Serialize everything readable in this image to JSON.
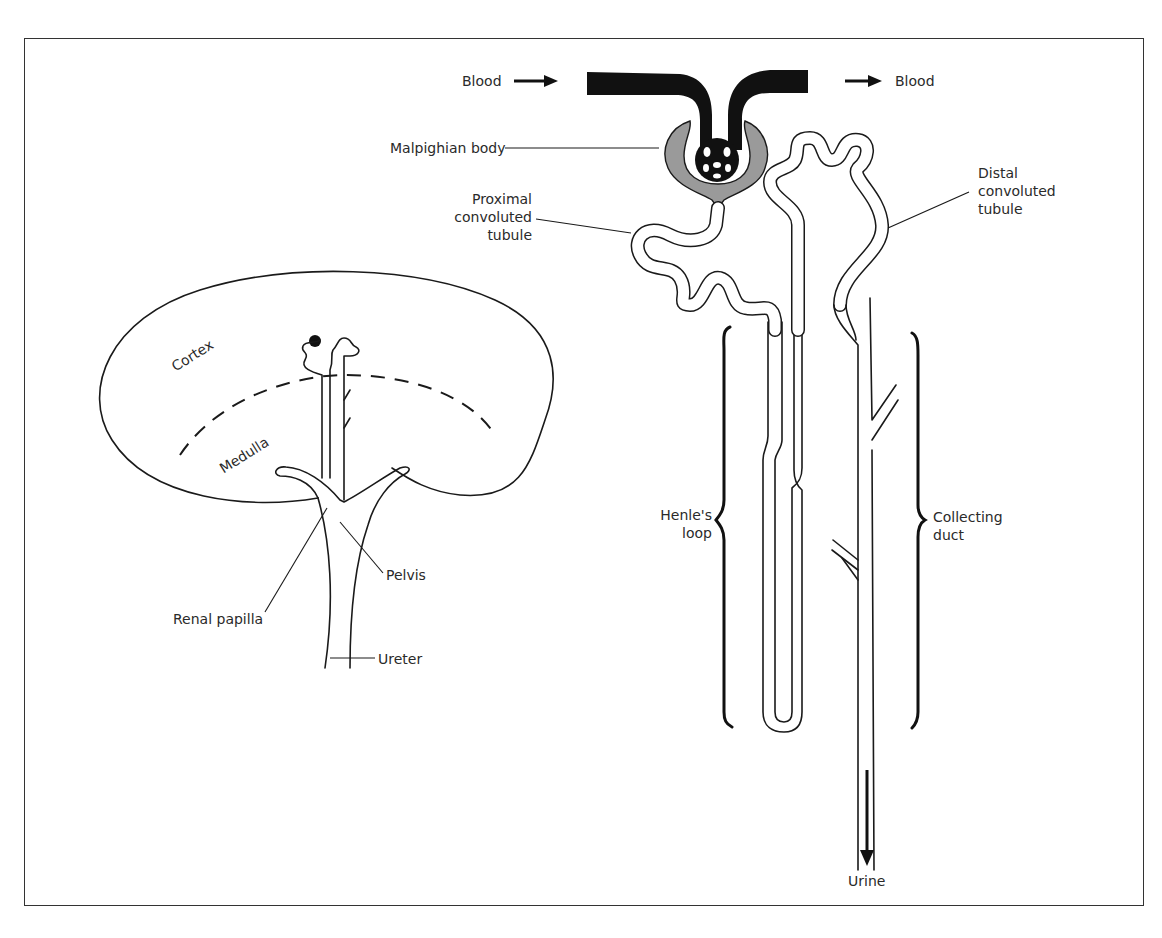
{
  "figure": {
    "kidney": {
      "regions": [
        "Cortex",
        "Medulla"
      ],
      "labels": {
        "cortex": "Cortex",
        "medulla": "Medulla",
        "pelvis": "Pelvis",
        "renal_papilla": "Renal papilla",
        "ureter": "Ureter"
      }
    },
    "nephron": {
      "labels": {
        "blood_in": "Blood",
        "blood_out": "Blood",
        "malpighian_body": "Malpighian body",
        "proximal_line1": "Proximal",
        "proximal_line2": "convoluted",
        "proximal_line3": "tubule",
        "distal_line1": "Distal",
        "distal_line2": "convoluted",
        "distal_line3": "tubule",
        "henle_line1": "Henle's",
        "henle_line2": "loop",
        "collecting_line1": "Collecting",
        "collecting_line2": "duct",
        "urine": "Urine"
      },
      "flow": [
        "Blood",
        "Malpighian body",
        "Proximal convoluted tubule",
        "Henle's loop",
        "Distal convoluted tubule",
        "Collecting duct",
        "Urine"
      ]
    },
    "colors": {
      "ink": "#1a1a1a",
      "capsule_fill": "#9a9a9a",
      "background": "#ffffff",
      "frame": "#333333"
    }
  }
}
